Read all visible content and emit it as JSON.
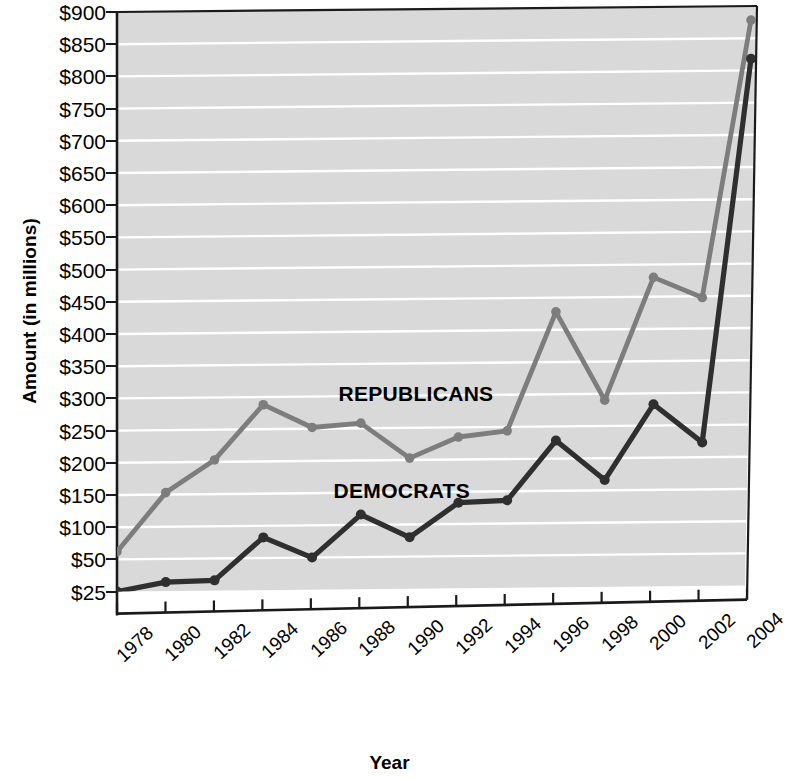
{
  "chart_data": {
    "type": "line",
    "title": "",
    "xlabel": "Year",
    "ylabel": "Amount (in millions)",
    "categories": [
      1978,
      1980,
      1982,
      1984,
      1986,
      1988,
      1990,
      1992,
      1994,
      1996,
      1998,
      2000,
      2002,
      2004
    ],
    "xtick_labels": [
      "1978",
      "1980",
      "1982",
      "1984",
      "1986",
      "1988",
      "1990",
      "1992",
      "1994",
      "1996",
      "1998",
      "2000",
      "2002",
      "2004"
    ],
    "ytick_labels": [
      "$900",
      "$850",
      "$800",
      "$750",
      "$700",
      "$650",
      "$600",
      "$550",
      "$500",
      "$450",
      "$400",
      "$350",
      "$300",
      "$250",
      "$200",
      "$150",
      "$100",
      "$50",
      "$25"
    ],
    "ytick_values": [
      900,
      850,
      800,
      750,
      700,
      650,
      600,
      550,
      500,
      450,
      400,
      350,
      300,
      250,
      200,
      150,
      100,
      50,
      25
    ],
    "ylim": [
      25,
      900
    ],
    "grid": "horizontal",
    "legend": "inline-annotations",
    "series": [
      {
        "name": "REPUBLICANS",
        "color": "#7d7d7d",
        "label_x": 1987.0,
        "label_y": 300,
        "values": [
          62,
          153,
          203,
          288,
          252,
          258,
          203,
          235,
          244,
          428,
          290,
          480,
          448,
          878
        ]
      },
      {
        "name": "DEMOCRATS",
        "color": "#2f2f2f",
        "label_x": 1986.8,
        "label_y": 150,
        "values": [
          25,
          32,
          33,
          82,
          50,
          116,
          80,
          133,
          136,
          228,
          166,
          283,
          223,
          818
        ]
      }
    ]
  },
  "axes": {
    "y_title": "Amount (in millions)",
    "x_title": "Year"
  },
  "style": {
    "plot_background": "#d9d9d9",
    "gridline_color": "#ffffff",
    "axis_color": "#1a1a1a",
    "republican_color": "#7d7d7d",
    "democrat_color": "#2f2f2f"
  }
}
